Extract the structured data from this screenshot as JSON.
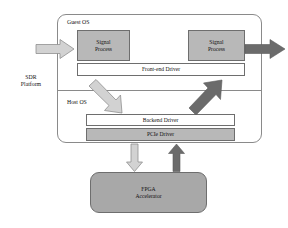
{
  "diagram": {
    "title_visible": false,
    "platform": {
      "label": "SDR\nPlatform",
      "regions": [
        {
          "name": "guest-os",
          "label": "Guest OS"
        },
        {
          "name": "host-os",
          "label": "Host OS"
        }
      ]
    },
    "blocks": [
      {
        "id": "signal-process-left",
        "label": "Signal\nProcess",
        "fill": "#b8b8b8",
        "shape": "rect"
      },
      {
        "id": "signal-process-right",
        "label": "Signal\nProcess",
        "fill": "#b8b8b8",
        "shape": "rect"
      },
      {
        "id": "frontend-driver",
        "label": "Front-end Driver",
        "fill": "#ffffff",
        "shape": "rect"
      },
      {
        "id": "backend-driver",
        "label": "Backend Driver",
        "fill": "#ffffff",
        "shape": "rect"
      },
      {
        "id": "pcie-driver",
        "label": "PCIe Driver",
        "fill": "#b8b8b8",
        "shape": "rect"
      },
      {
        "id": "fpga-accelerator",
        "label": "FPGA\nAccelerator",
        "fill": "#a8a8a8",
        "shape": "rounded-rect"
      }
    ],
    "arrows": [
      {
        "id": "input-arrow",
        "direction": "right",
        "style": "light"
      },
      {
        "id": "output-arrow",
        "direction": "right",
        "style": "dark"
      },
      {
        "id": "downlink-arrow",
        "direction": "down-right",
        "style": "light"
      },
      {
        "id": "uplink-arrow",
        "direction": "up-right",
        "style": "dark"
      },
      {
        "id": "to-fpga-arrow",
        "direction": "down",
        "style": "light"
      },
      {
        "id": "from-fpga-arrow",
        "direction": "up",
        "style": "dark"
      }
    ],
    "colors": {
      "frame_stroke": "#8a8a8a",
      "box_stroke": "#6e6e6e",
      "gray_fill": "#b8b8b8",
      "white_fill": "#ffffff",
      "fpga_fill": "#a8a8a8",
      "arrow_light": "#d2d2d2",
      "arrow_dark": "#6b6b6b",
      "text": "#111111"
    }
  }
}
